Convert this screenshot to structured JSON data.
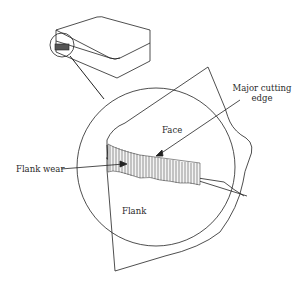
{
  "diagram": {
    "labels": {
      "face": "Face",
      "flank": "Flank",
      "flank_wear": "Flank wear",
      "major_cutting_edge_line1": "Major cutting",
      "major_cutting_edge_line2": "edge"
    },
    "colors": {
      "line": "#222222",
      "background": "#ffffff"
    }
  }
}
